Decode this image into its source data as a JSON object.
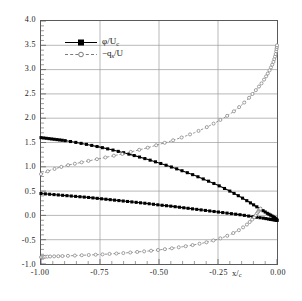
{
  "chart_data": {
    "type": "line",
    "title": "",
    "subtitle": "",
    "xlabel": "x/c",
    "ylabel": "",
    "xlim": [
      -1.0,
      0.0
    ],
    "ylim": [
      -1.0,
      4.0
    ],
    "grid": true,
    "legend_position": "upper-left-inside",
    "xticks": [
      -1.0,
      -0.75,
      -0.5,
      -0.25,
      0.0
    ],
    "xtick_labels": [
      "-1.00",
      "-0.75",
      "-0.50",
      "-0.25",
      "0.00"
    ],
    "yticks": [
      -1.0,
      -0.5,
      0.0,
      0.5,
      1.0,
      1.5,
      2.0,
      2.5,
      3.0,
      3.5,
      4.0
    ],
    "ytick_labels": [
      "-1.0",
      "-0.5",
      "0.0",
      "0.5",
      "1.0",
      "1.5",
      "2.0",
      "2.5",
      "3.0",
      "3.5",
      "4.0"
    ],
    "x_minor_ticks_per_interval": 5,
    "y_minor_ticks_per_interval": 5,
    "series": [
      {
        "name": "phi/Uc",
        "label_html": "&#966;/U<span class=\"sub\">c</span>",
        "style": "solid-filled-squares",
        "color": "#000000",
        "marker": "filled-square",
        "branches": [
          {
            "name": "upper",
            "x": [
              -1.0,
              -0.975,
              -0.95,
              -0.925,
              -0.9,
              -0.85,
              -0.8,
              -0.75,
              -0.7,
              -0.65,
              -0.6,
              -0.55,
              -0.5,
              -0.45,
              -0.4,
              -0.35,
              -0.3,
              -0.25,
              -0.2,
              -0.16,
              -0.12,
              -0.09,
              -0.06,
              -0.04,
              -0.025,
              -0.012,
              -0.005,
              0.0
            ],
            "y": [
              1.6,
              1.585,
              1.57,
              1.555,
              1.54,
              1.5,
              1.455,
              1.405,
              1.35,
              1.29,
              1.225,
              1.155,
              1.08,
              1.0,
              0.915,
              0.825,
              0.725,
              0.62,
              0.5,
              0.395,
              0.28,
              0.19,
              0.1,
              0.04,
              0.0,
              -0.04,
              -0.07,
              -0.1
            ]
          },
          {
            "name": "lower",
            "x": [
              -1.0,
              -0.95,
              -0.9,
              -0.85,
              -0.8,
              -0.75,
              -0.7,
              -0.65,
              -0.6,
              -0.55,
              -0.5,
              -0.45,
              -0.4,
              -0.35,
              -0.3,
              -0.25,
              -0.2,
              -0.15,
              -0.1,
              -0.06,
              -0.03,
              -0.015,
              0.0
            ],
            "y": [
              0.45,
              0.43,
              0.41,
              0.39,
              0.37,
              0.345,
              0.32,
              0.295,
              0.27,
              0.245,
              0.215,
              0.19,
              0.16,
              0.13,
              0.1,
              0.07,
              0.04,
              0.01,
              -0.03,
              -0.055,
              -0.08,
              -0.09,
              -0.1
            ]
          }
        ]
      },
      {
        "name": "-q_s/U",
        "label_html": "&#8722;q<span class=\"sub\">s</span>/U",
        "style": "dashed-open-circles",
        "color": "#7a7a7a",
        "marker": "open-circle",
        "branches": [
          {
            "name": "upper",
            "x": [
              -1.0,
              -0.96,
              -0.92,
              -0.88,
              -0.84,
              -0.8,
              -0.75,
              -0.7,
              -0.65,
              -0.6,
              -0.55,
              -0.5,
              -0.45,
              -0.4,
              -0.35,
              -0.3,
              -0.26,
              -0.22,
              -0.18,
              -0.15,
              -0.12,
              -0.1,
              -0.08,
              -0.065,
              -0.05,
              -0.04,
              -0.03,
              -0.022,
              -0.015,
              -0.01,
              -0.006,
              -0.003,
              -0.001,
              0.0
            ],
            "y": [
              0.85,
              0.93,
              0.99,
              1.04,
              1.08,
              1.12,
              1.17,
              1.22,
              1.27,
              1.33,
              1.39,
              1.46,
              1.53,
              1.61,
              1.7,
              1.81,
              1.91,
              2.02,
              2.15,
              2.27,
              2.41,
              2.52,
              2.63,
              2.72,
              2.83,
              2.91,
              3.0,
              3.08,
              3.16,
              3.24,
              3.31,
              3.39,
              3.45,
              3.5
            ]
          },
          {
            "name": "lower",
            "x": [
              -1.0,
              -0.99,
              -0.98,
              -0.96,
              -0.93,
              -0.9,
              -0.85,
              -0.8,
              -0.75,
              -0.7,
              -0.65,
              -0.6,
              -0.55,
              -0.5,
              -0.45,
              -0.4,
              -0.35,
              -0.3,
              -0.25,
              -0.2,
              -0.16,
              -0.13,
              -0.11,
              -0.095,
              -0.085,
              -0.078,
              -0.073,
              -0.07
            ],
            "y": [
              -0.86,
              -0.855,
              -0.85,
              -0.845,
              -0.84,
              -0.835,
              -0.825,
              -0.815,
              -0.805,
              -0.79,
              -0.775,
              -0.755,
              -0.735,
              -0.71,
              -0.68,
              -0.645,
              -0.605,
              -0.555,
              -0.49,
              -0.4,
              -0.3,
              -0.2,
              -0.11,
              -0.03,
              0.04,
              0.09,
              0.12,
              0.14
            ]
          }
        ]
      }
    ]
  },
  "legend": {
    "entries": [
      {
        "label": "φ/Uc"
      },
      {
        "label": "−qs/U"
      }
    ]
  },
  "axes": {
    "x_title": "x/c",
    "x_title_main": "x/",
    "x_title_sub": "c"
  },
  "colors": {
    "series_1": "#000000",
    "series_2": "#7a7a7a",
    "grid": "#9a9a9a",
    "frame": "#5a5a5a",
    "text": "#1a1a1a",
    "background": "#ffffff"
  }
}
